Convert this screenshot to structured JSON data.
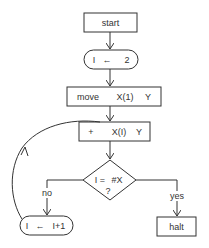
{
  "flowchart": {
    "nodes": {
      "start": {
        "label": "start",
        "shape": "rectangle"
      },
      "init": {
        "parts": [
          "I",
          "←",
          "2"
        ],
        "shape": "rounded"
      },
      "move": {
        "parts": [
          "move",
          "X(1)",
          "Y"
        ],
        "shape": "rectangle"
      },
      "add": {
        "parts": [
          "+",
          "X(I)",
          "Y"
        ],
        "shape": "rectangle"
      },
      "decision": {
        "line1": [
          "I =",
          "#X"
        ],
        "line2": "?",
        "shape": "diamond"
      },
      "increment": {
        "parts": [
          "I",
          "←",
          "I+1"
        ],
        "shape": "rounded"
      },
      "halt": {
        "label": "halt",
        "shape": "rectangle"
      }
    },
    "edges": {
      "no_label": "no",
      "yes_label": "yes"
    },
    "colors": {
      "stroke": "#333333",
      "background": "#ffffff"
    }
  }
}
